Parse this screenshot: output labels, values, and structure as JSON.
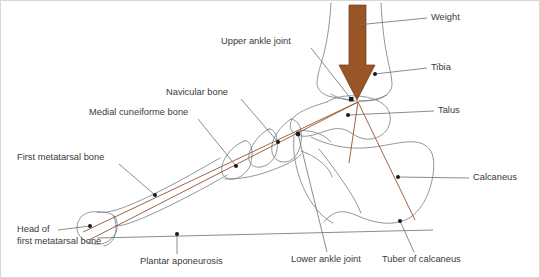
{
  "diagram": {
    "colors": {
      "arrow": "#9a5526",
      "lever_line": "#9d5a33",
      "bone_outline": "#7a8490",
      "leader_line": "#6e6e6e",
      "label_text": "#3a3a3a",
      "background": "#ffffff",
      "border": "#d8d8d8"
    },
    "labels": [
      {
        "id": "weight",
        "text": "Weight",
        "x": 430,
        "y": 17,
        "align": "start"
      },
      {
        "id": "tibia",
        "text": "Tibia",
        "x": 430,
        "y": 67,
        "align": "start"
      },
      {
        "id": "talus",
        "text": "Talus",
        "x": 437,
        "y": 110,
        "align": "start"
      },
      {
        "id": "calcaneus",
        "text": "Calcaneus",
        "x": 472,
        "y": 177,
        "align": "start"
      },
      {
        "id": "upper-ankle-joint",
        "text": "Upper ankle joint",
        "x": 220,
        "y": 41,
        "align": "start"
      },
      {
        "id": "navicular-bone",
        "text": "Navicular bone",
        "x": 165,
        "y": 92,
        "align": "start"
      },
      {
        "id": "medial-cuneiforme",
        "text": "Medial cuneiforme bone",
        "x": 88,
        "y": 112,
        "align": "start"
      },
      {
        "id": "first-metatarsal",
        "text": "First metatarsal bone",
        "x": 16,
        "y": 157,
        "align": "start"
      },
      {
        "id": "plantar-aponeurosis",
        "text": "Plantar aponeurosis",
        "x": 139,
        "y": 261,
        "align": "start"
      },
      {
        "id": "lower-ankle-joint",
        "text": "Lower ankle joint",
        "x": 290,
        "y": 259,
        "align": "start"
      },
      {
        "id": "tuber-of-calcaneus",
        "text": "Tuber of calcaneus",
        "x": 381,
        "y": 259,
        "align": "start"
      }
    ],
    "head_label": {
      "id": "head-of-first-metatarsal",
      "line1": "Head of",
      "line2": "first metatarsal bone",
      "x": 16,
      "y1": 229,
      "y2": 241
    }
  }
}
